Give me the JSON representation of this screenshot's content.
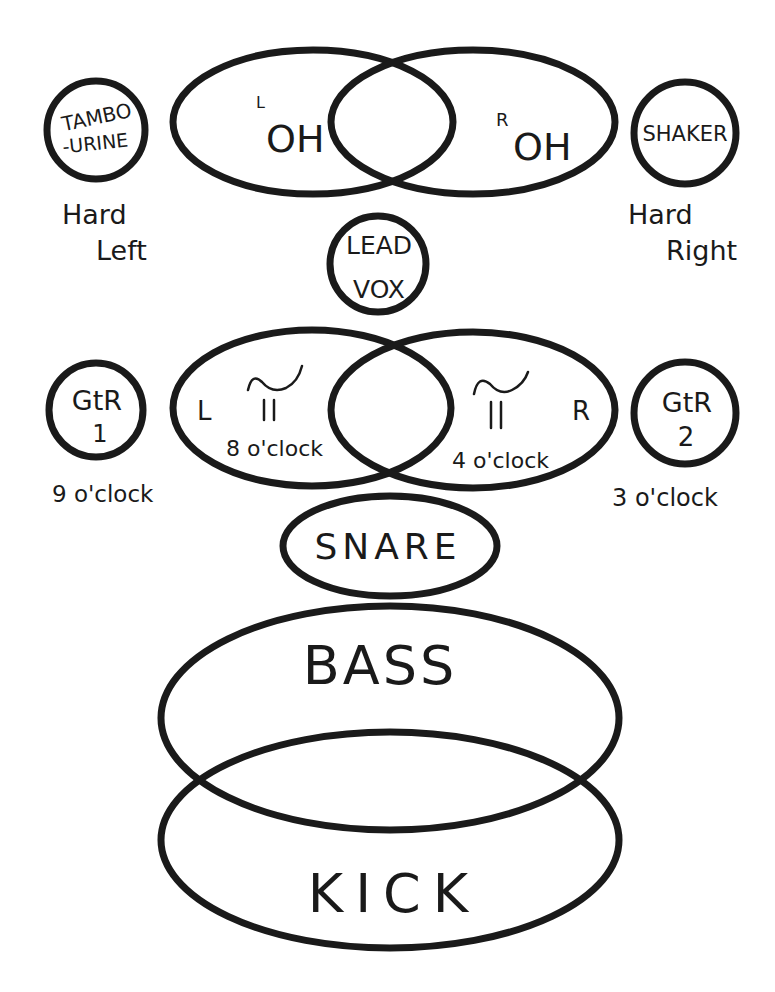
{
  "diagram": {
    "top_row": {
      "left_instrument": {
        "label_line1": "TAMBO",
        "label_line2": "-URINE",
        "pan": [
          "Hard",
          "Left"
        ]
      },
      "overhead_left": {
        "superscript": "L",
        "label": "OH"
      },
      "overhead_right": {
        "superscript": "R",
        "label": "OH"
      },
      "right_instrument": {
        "label": "SHAKER",
        "pan": [
          "Hard",
          "Right"
        ]
      }
    },
    "lead_vocal": {
      "label_line1": "LEAD",
      "label_line2": "VOX"
    },
    "middle_row": {
      "guitar_1": {
        "label": "GtR",
        "number": "1",
        "pan": "9 o'clock"
      },
      "keys_left": {
        "side": "L",
        "position": "8 o'clock"
      },
      "keys_right": {
        "side": "R",
        "position": "4 o'clock"
      },
      "guitar_2": {
        "label": "GtR",
        "number": "2",
        "pan": "3 o'clock"
      }
    },
    "snare": {
      "label": "SNARE"
    },
    "bass": {
      "label": "BASS"
    },
    "kick": {
      "label": "KICK"
    },
    "stroke_color": "#1a1a1a",
    "background_color": "#ffffff"
  }
}
